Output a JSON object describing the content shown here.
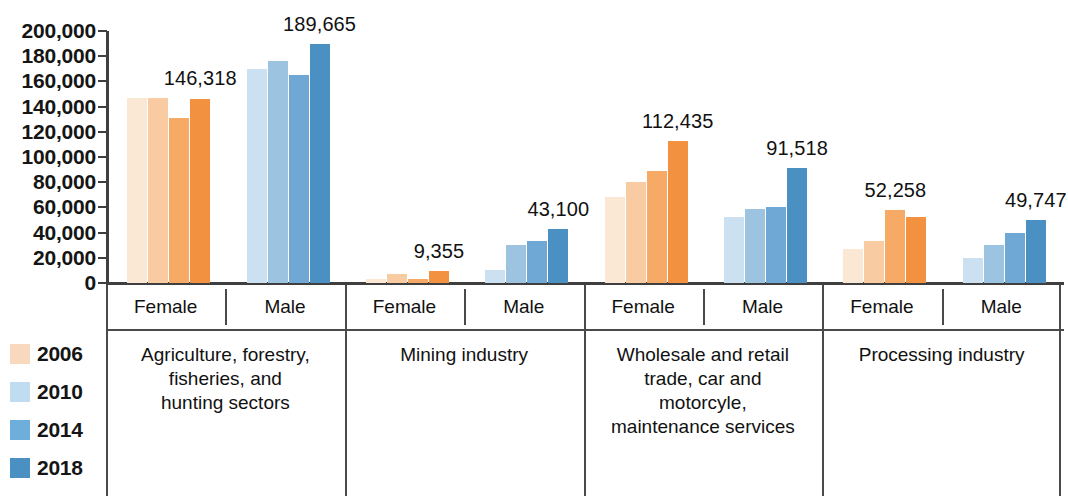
{
  "chart_data": {
    "type": "bar",
    "title": "",
    "subtitle": "",
    "xlabel": "",
    "ylabel": "",
    "ylim": [
      0,
      200000
    ],
    "grid": false,
    "legend_position": "left-bottom",
    "y_ticks": [
      "0",
      "20,000",
      "40,000",
      "60,000",
      "80,000",
      "100,000",
      "120,000",
      "140,000",
      "160,000",
      "180,000",
      "200,000"
    ],
    "y_tick_values": [
      0,
      20000,
      40000,
      60000,
      80000,
      100000,
      120000,
      140000,
      160000,
      180000,
      200000
    ],
    "series": [
      {
        "name": "2006",
        "color_female": "#FAE7D4",
        "color_male": "#CBE0F1"
      },
      {
        "name": "2010",
        "color_female": "#F8CBA2",
        "color_male": "#9CC3E0"
      },
      {
        "name": "2014",
        "color_female": "#F6AA66",
        "color_male": "#6FA8D4"
      },
      {
        "name": "2018",
        "color_female": "#F2913F",
        "color_male": "#4A90C2"
      }
    ],
    "categories": [
      "Agriculture, forestry, fisheries, and hunting sectors",
      "Mining industry",
      "Wholesale and retail trade, car and motorcyle, maintenance services",
      "Processing industry"
    ],
    "groups": [
      {
        "sector": "Agriculture, forestry, fisheries, and hunting sectors",
        "sector_lines": [
          "Agriculture, forestry,",
          "fisheries, and",
          "hunting sectors"
        ],
        "genders": [
          {
            "gender": "Female",
            "values": [
              147000,
              147000,
              131000,
              146318
            ],
            "label": "146,318",
            "label_series": "2018"
          },
          {
            "gender": "Male",
            "values": [
              170000,
              176000,
              165000,
              189665
            ],
            "label": "189,665",
            "label_series": "2018"
          }
        ]
      },
      {
        "sector": "Mining industry",
        "sector_lines": [
          "Mining industry"
        ],
        "genders": [
          {
            "gender": "Female",
            "values": [
              3000,
              7000,
              3000,
              9355
            ],
            "label": "9,355",
            "label_series": "2018"
          },
          {
            "gender": "Male",
            "values": [
              10000,
              30000,
              33000,
              43100
            ],
            "label": "43,100",
            "label_series": "2018"
          }
        ]
      },
      {
        "sector": "Wholesale and retail trade, car and motorcyle, maintenance services",
        "sector_lines": [
          "Wholesale and retail",
          "trade, car and",
          "motorcyle,",
          "maintenance services"
        ],
        "genders": [
          {
            "gender": "Female",
            "values": [
              68000,
              80000,
              89000,
              112435
            ],
            "label": "112,435",
            "label_series": "2018"
          },
          {
            "gender": "Male",
            "values": [
              52000,
              59000,
              60000,
              91518
            ],
            "label": "91,518",
            "label_series": "2018"
          }
        ]
      },
      {
        "sector": "Processing industry",
        "sector_lines": [
          "Processing industry"
        ],
        "genders": [
          {
            "gender": "Female",
            "values": [
              27000,
              33000,
              58000,
              52258
            ],
            "label": "52,258",
            "label_series": "2014"
          },
          {
            "gender": "Male",
            "values": [
              20000,
              30000,
              40000,
              49747
            ],
            "label": "49,747",
            "label_series": "2018"
          }
        ]
      }
    ],
    "legend": [
      {
        "label": "2006",
        "color": "#F9D9BD"
      },
      {
        "label": "2010",
        "color": "#BFDCF1"
      },
      {
        "label": "2014",
        "color": "#6DAEDB"
      },
      {
        "label": "2018",
        "color": "#4A90C2"
      }
    ]
  }
}
